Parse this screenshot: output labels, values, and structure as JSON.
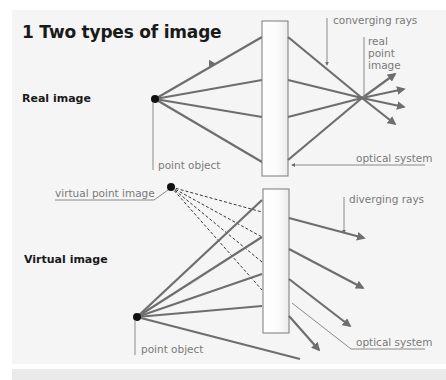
{
  "title": "1 Two types of image",
  "colors": {
    "panel_background": "#f5f5f5",
    "ray": "#6e6e6e",
    "leader_line": "#8a8a8a",
    "label_text": "#7a7a7a",
    "heading_text": "#1a1a1a",
    "point": "#111111"
  },
  "real_image": {
    "section_label": "Real image",
    "labels": {
      "converging_rays": "converging rays",
      "real_point_image_line1": "real",
      "real_point_image_line2": "point",
      "real_point_image_line3": "image",
      "point_object": "point object",
      "optical_system": "optical system"
    }
  },
  "virtual_image": {
    "section_label": "Virtual image",
    "labels": {
      "virtual_point_image": "virtual point image",
      "diverging_rays": "diverging rays",
      "point_object": "point object",
      "optical_system": "optical system"
    }
  }
}
